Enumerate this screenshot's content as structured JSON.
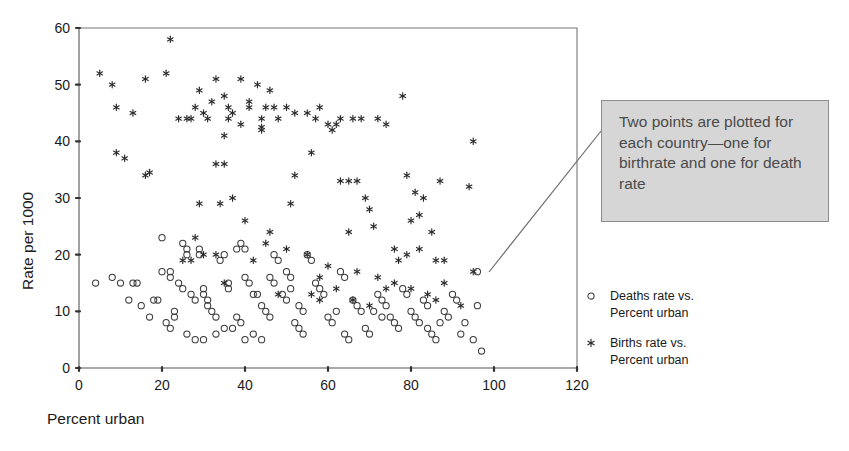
{
  "chart_data": {
    "type": "scatter",
    "title": "",
    "xlabel": "Percent urban",
    "ylabel": "Rate per 1000",
    "xlim": [
      0,
      120
    ],
    "ylim": [
      0,
      60
    ],
    "xticks": [
      0,
      20,
      40,
      60,
      80,
      100,
      120
    ],
    "yticks": [
      0,
      10,
      20,
      30,
      40,
      50,
      60
    ],
    "grid": false,
    "legend_position": "right",
    "series": [
      {
        "name": "Births rate vs. Percent urban",
        "marker": "asterisk",
        "points": [
          [
            22,
            58
          ],
          [
            5,
            52
          ],
          [
            16,
            51
          ],
          [
            21,
            52
          ],
          [
            33,
            51
          ],
          [
            39,
            51
          ],
          [
            8,
            50
          ],
          [
            43,
            50
          ],
          [
            46,
            49
          ],
          [
            29,
            49
          ],
          [
            35,
            48
          ],
          [
            78,
            48
          ],
          [
            32,
            47
          ],
          [
            9,
            46
          ],
          [
            28,
            46
          ],
          [
            36,
            46
          ],
          [
            41,
            46
          ],
          [
            45,
            46
          ],
          [
            47,
            46
          ],
          [
            50,
            46
          ],
          [
            13,
            45
          ],
          [
            26,
            44
          ],
          [
            27,
            44
          ],
          [
            31,
            44
          ],
          [
            36,
            44
          ],
          [
            44,
            44
          ],
          [
            57,
            44
          ],
          [
            63,
            44
          ],
          [
            66,
            44
          ],
          [
            68,
            44
          ],
          [
            72,
            44
          ],
          [
            62,
            43
          ],
          [
            39,
            43
          ],
          [
            44,
            42
          ],
          [
            44,
            42.5
          ],
          [
            35,
            41
          ],
          [
            95,
            40
          ],
          [
            9,
            38
          ],
          [
            56,
            38
          ],
          [
            11,
            37
          ],
          [
            33,
            36
          ],
          [
            35,
            36
          ],
          [
            16,
            34
          ],
          [
            17,
            34.5
          ],
          [
            52,
            34
          ],
          [
            79,
            34
          ],
          [
            63,
            33
          ],
          [
            65,
            33
          ],
          [
            67,
            33
          ],
          [
            87,
            33
          ],
          [
            81,
            31
          ],
          [
            29,
            29
          ],
          [
            34,
            29
          ],
          [
            51,
            29
          ],
          [
            83,
            30
          ],
          [
            37,
            30
          ],
          [
            70,
            28
          ],
          [
            94,
            32
          ],
          [
            82,
            27
          ],
          [
            40,
            26
          ],
          [
            80,
            26
          ],
          [
            46,
            24
          ],
          [
            45,
            22
          ],
          [
            65,
            24
          ],
          [
            85,
            24
          ],
          [
            28,
            23
          ],
          [
            50,
            21
          ],
          [
            76,
            21
          ],
          [
            82,
            21
          ],
          [
            30,
            20
          ],
          [
            33,
            20
          ],
          [
            55,
            20
          ],
          [
            79,
            20
          ],
          [
            88,
            19
          ],
          [
            25,
            19
          ],
          [
            27,
            19
          ],
          [
            42,
            19
          ],
          [
            77,
            19
          ],
          [
            86,
            19
          ],
          [
            60,
            18
          ],
          [
            67,
            17
          ],
          [
            95,
            17
          ],
          [
            58,
            16
          ],
          [
            72,
            16
          ],
          [
            76,
            15
          ],
          [
            88,
            15
          ],
          [
            62,
            14
          ],
          [
            74,
            14
          ],
          [
            80,
            14
          ],
          [
            84,
            13
          ],
          [
            35,
            15
          ],
          [
            48,
            13
          ],
          [
            56,
            13
          ],
          [
            58,
            12
          ],
          [
            66,
            12
          ],
          [
            92,
            11
          ],
          [
            70,
            11
          ],
          [
            86,
            12
          ],
          [
            41,
            47
          ],
          [
            52,
            45
          ],
          [
            55,
            45
          ],
          [
            58,
            46
          ],
          [
            24,
            44
          ],
          [
            30,
            45
          ],
          [
            37,
            45
          ],
          [
            48,
            44
          ],
          [
            60,
            43
          ],
          [
            61,
            42
          ],
          [
            74,
            43
          ],
          [
            69,
            30
          ],
          [
            71,
            25
          ]
        ]
      },
      {
        "name": "Deaths rate vs. Percent urban",
        "marker": "circle",
        "points": [
          [
            4,
            15
          ],
          [
            8,
            16
          ],
          [
            10,
            15
          ],
          [
            13,
            15
          ],
          [
            14,
            15
          ],
          [
            20,
            17
          ],
          [
            20,
            23
          ],
          [
            25,
            22
          ],
          [
            26,
            21
          ],
          [
            26,
            20
          ],
          [
            22,
            16
          ],
          [
            22,
            17
          ],
          [
            24,
            15
          ],
          [
            25,
            14
          ],
          [
            18,
            12
          ],
          [
            19,
            12
          ],
          [
            23,
            10
          ],
          [
            23,
            9
          ],
          [
            27,
            13
          ],
          [
            28,
            12
          ],
          [
            30,
            14
          ],
          [
            30,
            13
          ],
          [
            31,
            12
          ],
          [
            31,
            11
          ],
          [
            32,
            10
          ],
          [
            33,
            9
          ],
          [
            29,
            21
          ],
          [
            29,
            20
          ],
          [
            34,
            19
          ],
          [
            35,
            20
          ],
          [
            36,
            15
          ],
          [
            36,
            14
          ],
          [
            33,
            6
          ],
          [
            35,
            7
          ],
          [
            37,
            7
          ],
          [
            38,
            21
          ],
          [
            39,
            22
          ],
          [
            40,
            21
          ],
          [
            40,
            16
          ],
          [
            41,
            15
          ],
          [
            42,
            13
          ],
          [
            43,
            13
          ],
          [
            38,
            9
          ],
          [
            39,
            8
          ],
          [
            40,
            5
          ],
          [
            44,
            11
          ],
          [
            45,
            10
          ],
          [
            46,
            9
          ],
          [
            47,
            20
          ],
          [
            48,
            19
          ],
          [
            49,
            13
          ],
          [
            50,
            12
          ],
          [
            51,
            14
          ],
          [
            52,
            8
          ],
          [
            53,
            7
          ],
          [
            54,
            6
          ],
          [
            55,
            20
          ],
          [
            56,
            19
          ],
          [
            57,
            15
          ],
          [
            58,
            14
          ],
          [
            59,
            13
          ],
          [
            60,
            9
          ],
          [
            61,
            8
          ],
          [
            62,
            10
          ],
          [
            63,
            17
          ],
          [
            64,
            16
          ],
          [
            66,
            12
          ],
          [
            67,
            11
          ],
          [
            68,
            10
          ],
          [
            69,
            7
          ],
          [
            70,
            6
          ],
          [
            72,
            13
          ],
          [
            73,
            12
          ],
          [
            74,
            11
          ],
          [
            75,
            9
          ],
          [
            76,
            8
          ],
          [
            77,
            7
          ],
          [
            78,
            14
          ],
          [
            79,
            13
          ],
          [
            80,
            10
          ],
          [
            81,
            9
          ],
          [
            82,
            8
          ],
          [
            83,
            12
          ],
          [
            84,
            11
          ],
          [
            85,
            6
          ],
          [
            86,
            5
          ],
          [
            88,
            10
          ],
          [
            89,
            9
          ],
          [
            90,
            13
          ],
          [
            91,
            12
          ],
          [
            93,
            8
          ],
          [
            95,
            5
          ],
          [
            96,
            17
          ],
          [
            96,
            11
          ],
          [
            12,
            12
          ],
          [
            15,
            11
          ],
          [
            17,
            9
          ],
          [
            21,
            8
          ],
          [
            22,
            7
          ],
          [
            26,
            6
          ],
          [
            28,
            5
          ],
          [
            30,
            5
          ],
          [
            42,
            6
          ],
          [
            44,
            5
          ],
          [
            46,
            16
          ],
          [
            47,
            15
          ],
          [
            50,
            17
          ],
          [
            51,
            16
          ],
          [
            53,
            11
          ],
          [
            54,
            10
          ],
          [
            64,
            6
          ],
          [
            65,
            5
          ],
          [
            71,
            10
          ],
          [
            73,
            9
          ],
          [
            84,
            7
          ],
          [
            87,
            8
          ],
          [
            92,
            6
          ],
          [
            97,
            3
          ]
        ]
      }
    ]
  },
  "callout": {
    "text": "Two points are plotted for each country—one for birthrate and one for death rate"
  },
  "legend": {
    "entries": [
      {
        "marker_name": "circle-marker-icon",
        "label": "Deaths rate vs.\nPercent urban"
      },
      {
        "marker_name": "asterisk-marker-icon",
        "label": "Births rate vs.\nPercent urban"
      }
    ]
  },
  "colors": {
    "marker_stroke": "#3a3a3a",
    "frame": "#777777",
    "callout_bg": "#d6d6d6",
    "callout_border": "#8d8d8d",
    "callout_text": "#4a4a4a"
  }
}
